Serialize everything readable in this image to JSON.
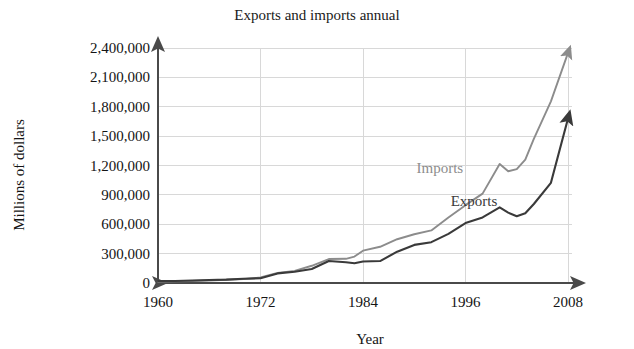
{
  "chart_data": {
    "type": "line",
    "title": "Exports and imports annual",
    "xlabel": "Year",
    "ylabel": "Millions of dollars",
    "xlim": [
      1960,
      2008
    ],
    "ylim": [
      0,
      2400000
    ],
    "grid": true,
    "legend_position": "inline-annotation",
    "xticks": [
      "1960",
      "1972",
      "1984",
      "1996",
      "2008"
    ],
    "xtick_values": [
      1960,
      1972,
      1984,
      1996,
      2008
    ],
    "yticks": [
      "0",
      "300,000",
      "600,000",
      "900,000",
      "1,200,000",
      "1,500,000",
      "1,800,000",
      "2,100,000",
      "2,400,000"
    ],
    "ytick_values": [
      0,
      300000,
      600000,
      900000,
      1200000,
      1500000,
      1800000,
      2100000,
      2400000
    ],
    "x": [
      1960,
      1962,
      1964,
      1966,
      1968,
      1970,
      1972,
      1974,
      1976,
      1978,
      1980,
      1982,
      1983,
      1984,
      1986,
      1988,
      1990,
      1992,
      1994,
      1996,
      1998,
      2000,
      2001,
      2002,
      2003,
      2004,
      2006,
      2008
    ],
    "series": [
      {
        "name": "Imports",
        "color": "#8c8c8c",
        "label_x": 1993,
        "label_y": 1120000,
        "values": [
          15000,
          17000,
          20000,
          26000,
          33000,
          40000,
          56000,
          103000,
          124000,
          176000,
          245000,
          247000,
          270000,
          330000,
          370000,
          447000,
          498000,
          537000,
          669000,
          795000,
          913000,
          1216000,
          1141000,
          1163000,
          1260000,
          1473000,
          1855000,
          2350000
        ]
      },
      {
        "name": "Exports",
        "color": "#3a3a3a",
        "label_x": 1997,
        "label_y": 790000,
        "values": [
          20000,
          21000,
          26000,
          30000,
          34000,
          43000,
          49000,
          98000,
          115000,
          143000,
          224000,
          212000,
          201000,
          220000,
          224000,
          320000,
          389000,
          417000,
          502000,
          612000,
          670000,
          772000,
          719000,
          682000,
          713000,
          807000,
          1023000,
          1680000
        ]
      }
    ]
  },
  "axis_decorations": {
    "y_axis_arrow": "arrow-up",
    "x_axis_arrow_right": "arrow-right",
    "x_axis_arrow_left": "arrow-left",
    "series_end_arrow": "arrow-up-right"
  }
}
